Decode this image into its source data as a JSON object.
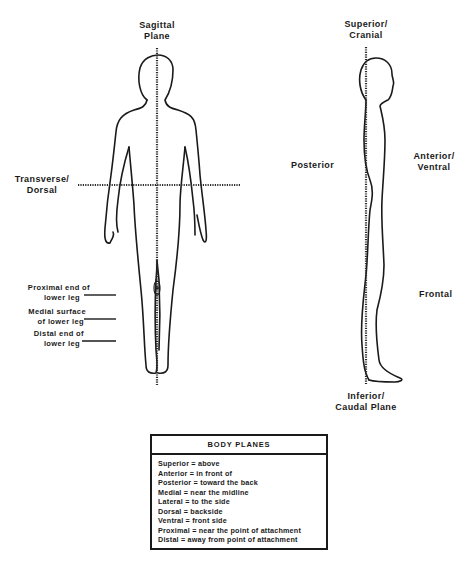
{
  "labels": {
    "sagittal": [
      "Sagittal",
      "Plane"
    ],
    "transverse": [
      "Transverse/",
      "Dorsal"
    ],
    "superior": [
      "Superior/",
      "Cranial"
    ],
    "posterior": "Posterior",
    "anterior": [
      "Anterior/",
      "Ventral"
    ],
    "frontal": "Frontal",
    "inferior": [
      "Inferior/",
      "Caudal  Plane"
    ],
    "proximal": [
      "Proximal end of",
      "lower leg"
    ],
    "medial": [
      "Medial surface",
      "of lower leg"
    ],
    "distal": [
      "Distal end of",
      "lower leg"
    ]
  },
  "legend": {
    "title": "BODY PLANES",
    "items": [
      "Superior = above",
      "Anterior = in front of",
      "Posterior = toward the back",
      "Medial = near the midline",
      "Lateral = to the side",
      "Dorsal = backside",
      "Ventral = front side",
      "Proximal = near the point of attachment",
      "Distal = away from point of attachment"
    ]
  }
}
